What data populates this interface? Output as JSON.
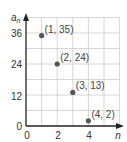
{
  "chart_data": {
    "type": "scatter",
    "title": "",
    "xlabel": "n",
    "ylabel": "a_n",
    "ylabel_main": "a",
    "ylabel_sub": "n",
    "xlim": [
      0,
      6
    ],
    "ylim": [
      0,
      42
    ],
    "x_ticks": [
      "0",
      "2",
      "4"
    ],
    "y_ticks": [
      "0",
      "12",
      "24",
      "36"
    ],
    "grid": true,
    "x": [
      1,
      2,
      3,
      4
    ],
    "y": [
      35,
      24,
      13,
      2
    ],
    "point_labels": [
      "(1, 35)",
      "(2, 24)",
      "(3, 13)",
      "(4, 2)"
    ],
    "colors": {
      "point": "#555555",
      "grid": "#cccccc",
      "axis": "#222222"
    }
  }
}
